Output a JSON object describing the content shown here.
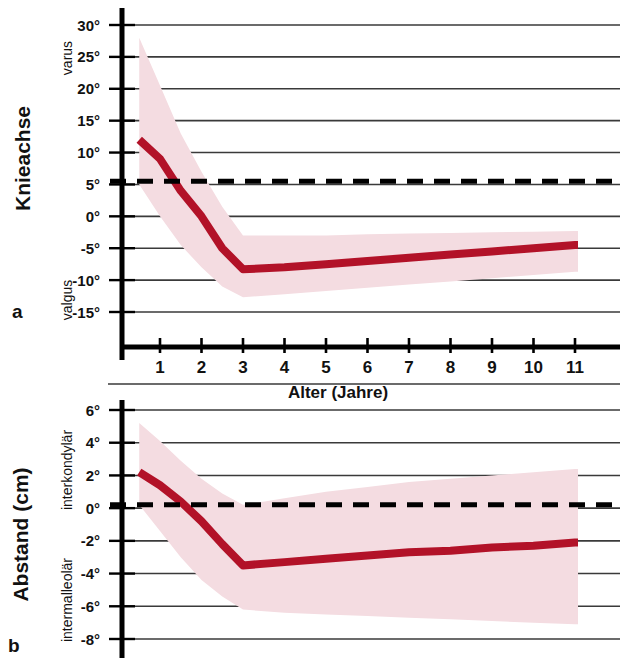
{
  "figure": {
    "panels": [
      {
        "letter": "a",
        "axis_title": "Knieachse",
        "top_direction_label": "varus",
        "bottom_direction_label": "valgus",
        "y_ticks": [
          "30°",
          "25°",
          "20°",
          "15°",
          "10°",
          "5°",
          "0°",
          "-5°",
          "-10°",
          "-15°"
        ]
      },
      {
        "letter": "b",
        "axis_title": "Abstand (cm)",
        "top_direction_label": "interkondylär",
        "bottom_direction_label": "intermalleolär",
        "y_ticks": [
          "6°",
          "4°",
          "2°",
          "0°",
          "-2°",
          "-4°",
          "-6°",
          "-8°"
        ]
      }
    ],
    "x_axis": {
      "title": "Alter (Jahre)",
      "ticks": [
        "1",
        "2",
        "3",
        "4",
        "5",
        "6",
        "7",
        "8",
        "9",
        "10",
        "11"
      ]
    },
    "colors": {
      "mean_line": "#b21228",
      "band": "#f4dce1",
      "grid": "#3a3a3a",
      "axis": "#000000",
      "reference_dash": "#000000"
    }
  },
  "chart_data": [
    {
      "type": "line",
      "title": "Knieachse",
      "panel": "a",
      "xlabel": "Alter (Jahre)",
      "ylabel": "Knieachse",
      "ylabel_top": "varus",
      "ylabel_bottom": "valgus",
      "xlim": [
        0.5,
        11.0
      ],
      "ylim": [
        -15,
        30
      ],
      "yticks": [
        30,
        25,
        20,
        15,
        10,
        5,
        0,
        -5,
        -10,
        -15
      ],
      "xticks": [
        1,
        2,
        3,
        4,
        5,
        6,
        7,
        8,
        9,
        10,
        11
      ],
      "grid": true,
      "legend": "none",
      "reference_line": {
        "value": 5.5,
        "style": "dashed",
        "label": ""
      },
      "x": [
        0.5,
        1,
        1.5,
        2,
        2.5,
        3,
        4,
        5,
        6,
        7,
        8,
        9,
        10,
        11
      ],
      "series": [
        {
          "name": "Mittelwert",
          "values": [
            12.0,
            9.0,
            4.0,
            0.0,
            -5.0,
            -8.3,
            -8.0,
            -7.5,
            -7.0,
            -6.5,
            -6.0,
            -5.5,
            -5.0,
            -4.5
          ]
        },
        {
          "name": "Streubereich oben",
          "values": [
            28.0,
            20.5,
            13.0,
            7.0,
            1.5,
            -3.0,
            -3.0,
            -3.0,
            -2.8,
            -2.7,
            -2.6,
            -2.5,
            -2.4,
            -2.3
          ]
        },
        {
          "name": "Streubereich unten",
          "values": [
            5.0,
            0.0,
            -4.5,
            -8.0,
            -11.0,
            -12.7,
            -12.2,
            -11.7,
            -11.2,
            -10.7,
            -10.2,
            -9.7,
            -9.2,
            -8.7
          ]
        }
      ]
    },
    {
      "type": "line",
      "title": "Abstand (cm)",
      "panel": "b",
      "xlabel": "Alter (Jahre)",
      "ylabel": "Abstand (cm)",
      "ylabel_top": "interkondylär",
      "ylabel_bottom": "intermalleolär",
      "xlim": [
        0.5,
        11.0
      ],
      "ylim": [
        -8,
        6
      ],
      "yticks": [
        6,
        4,
        2,
        0,
        -2,
        -4,
        -6,
        -8
      ],
      "xticks": [
        1,
        2,
        3,
        4,
        5,
        6,
        7,
        8,
        9,
        10,
        11
      ],
      "grid": true,
      "legend": "none",
      "reference_line": {
        "value": 0.2,
        "style": "dashed",
        "label": ""
      },
      "x": [
        0.5,
        1,
        1.5,
        2,
        2.5,
        3,
        4,
        5,
        6,
        7,
        8,
        9,
        10,
        11
      ],
      "series": [
        {
          "name": "Mittelwert",
          "values": [
            2.2,
            1.4,
            0.4,
            -0.8,
            -2.2,
            -3.5,
            -3.3,
            -3.1,
            -2.9,
            -2.7,
            -2.6,
            -2.4,
            -2.3,
            -2.1
          ]
        },
        {
          "name": "Streubereich oben",
          "values": [
            5.2,
            4.1,
            2.9,
            1.8,
            0.9,
            0.2,
            0.6,
            1.0,
            1.3,
            1.6,
            1.8,
            2.0,
            2.2,
            2.4
          ]
        },
        {
          "name": "Streubereich unten",
          "values": [
            0.2,
            -1.4,
            -3.0,
            -4.4,
            -5.4,
            -6.2,
            -6.4,
            -6.5,
            -6.6,
            -6.7,
            -6.8,
            -6.9,
            -7.0,
            -7.1
          ]
        }
      ]
    }
  ]
}
